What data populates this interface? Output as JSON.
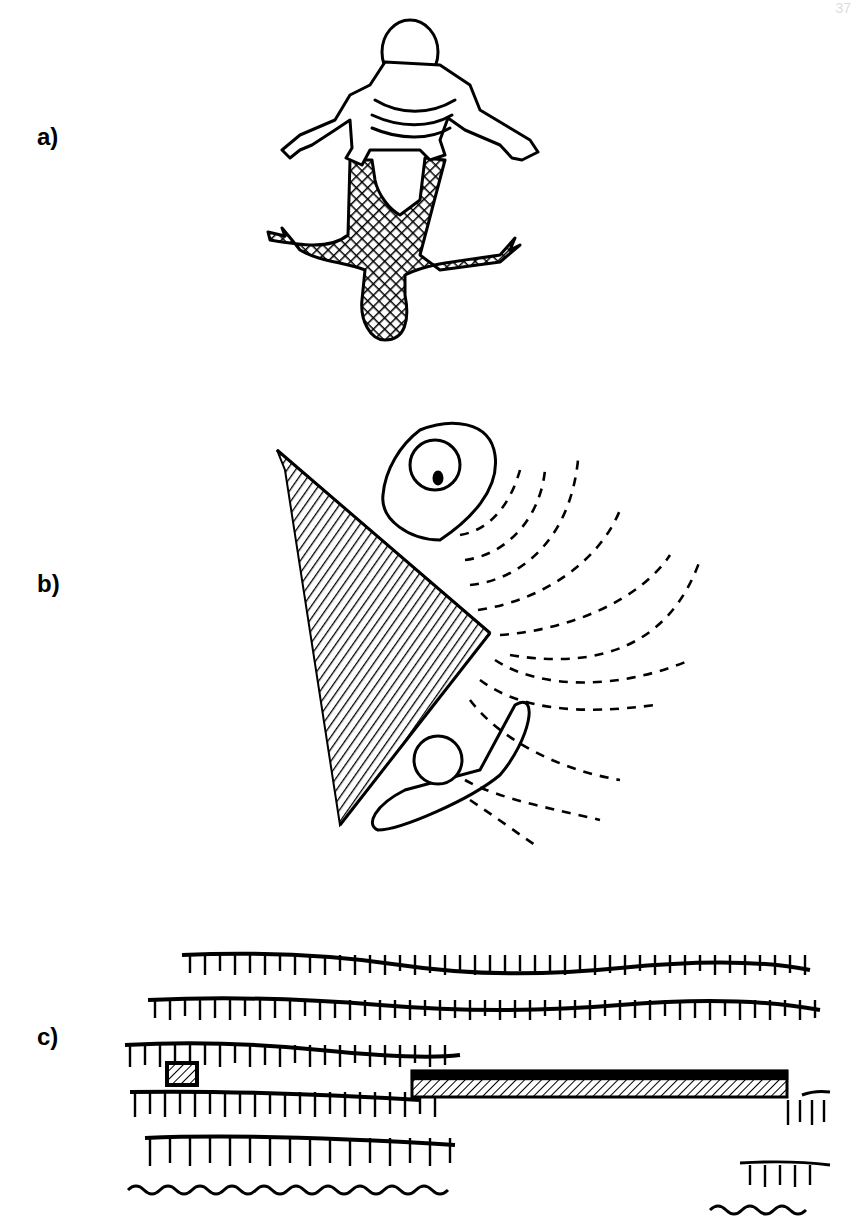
{
  "page": {
    "page_number_fragment": "37"
  },
  "figures": [
    {
      "label": "a)",
      "description": "Person seen from above with arms spread, casting a cross-hatched shadow below"
    },
    {
      "label": "b)",
      "description": "Two people on either side of a hatched triangular wall corner, with dashed sound-wave arcs radiating to the right"
    },
    {
      "label": "c)",
      "description": "Rows of grass/hedge seen from above with a small hatched square at left and a long hatched bar bridging a gap"
    }
  ]
}
